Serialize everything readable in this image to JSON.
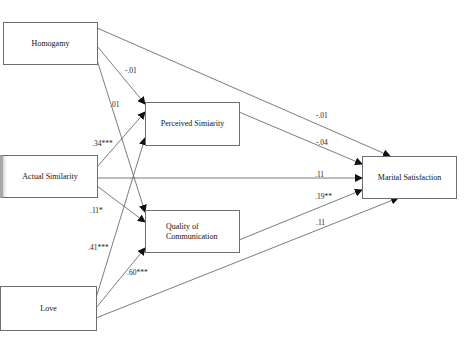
{
  "diagram": {
    "type": "path-model",
    "nodes": {
      "homogamy": {
        "label": "Homogamy"
      },
      "actual_similarity": {
        "label": "Actual Similarity"
      },
      "love": {
        "label": "Love"
      },
      "perceived_similarity": {
        "label": "Perceived Simiarity"
      },
      "quality_of_communication": {
        "label_line1": "Quality of",
        "label_line2": "Communication"
      },
      "marital_satisfaction": {
        "label": "Marital Satisfaction"
      }
    },
    "paths": [
      {
        "from": "Homogamy",
        "to": "Perceived Simiarity",
        "coef": "-.01"
      },
      {
        "from": "Homogamy",
        "to": "Quality of Communication",
        "coef": ".01"
      },
      {
        "from": "Homogamy",
        "to": "Marital Satisfaction",
        "coef": "-.01"
      },
      {
        "from": "Actual Similarity",
        "to": "Perceived Simiarity",
        "coef": ".34***"
      },
      {
        "from": "Actual Similarity",
        "to": "Quality of Communication",
        "coef": ".11*"
      },
      {
        "from": "Actual Similarity",
        "to": "Marital Satisfaction",
        "coef": ".11"
      },
      {
        "from": "Love",
        "to": "Perceived Simiarity",
        "coef": ".41***"
      },
      {
        "from": "Love",
        "to": "Quality of Communication",
        "coef": ".60***"
      },
      {
        "from": "Love",
        "to": "Marital Satisfaction",
        "coef": ".11"
      },
      {
        "from": "Perceived Simiarity",
        "to": "Marital Satisfaction",
        "coef": "-.04"
      },
      {
        "from": "Quality of Communication",
        "to": "Marital Satisfaction",
        "coef": ".19**"
      }
    ],
    "labels": {
      "hom_perc": "-.01",
      "hom_qual": ".01",
      "hom_mar": "-.01",
      "act_perc": ".34***",
      "act_qual": ".11*",
      "act_mar": ".11",
      "love_perc": ".41***",
      "love_qual": ".60***",
      "love_mar": ".11",
      "perc_mar": "-.04",
      "qual_mar": ".19**"
    },
    "colors": {
      "line": "#5a5a5a",
      "box_border": "#6e6e6e",
      "text": "#111111"
    }
  }
}
